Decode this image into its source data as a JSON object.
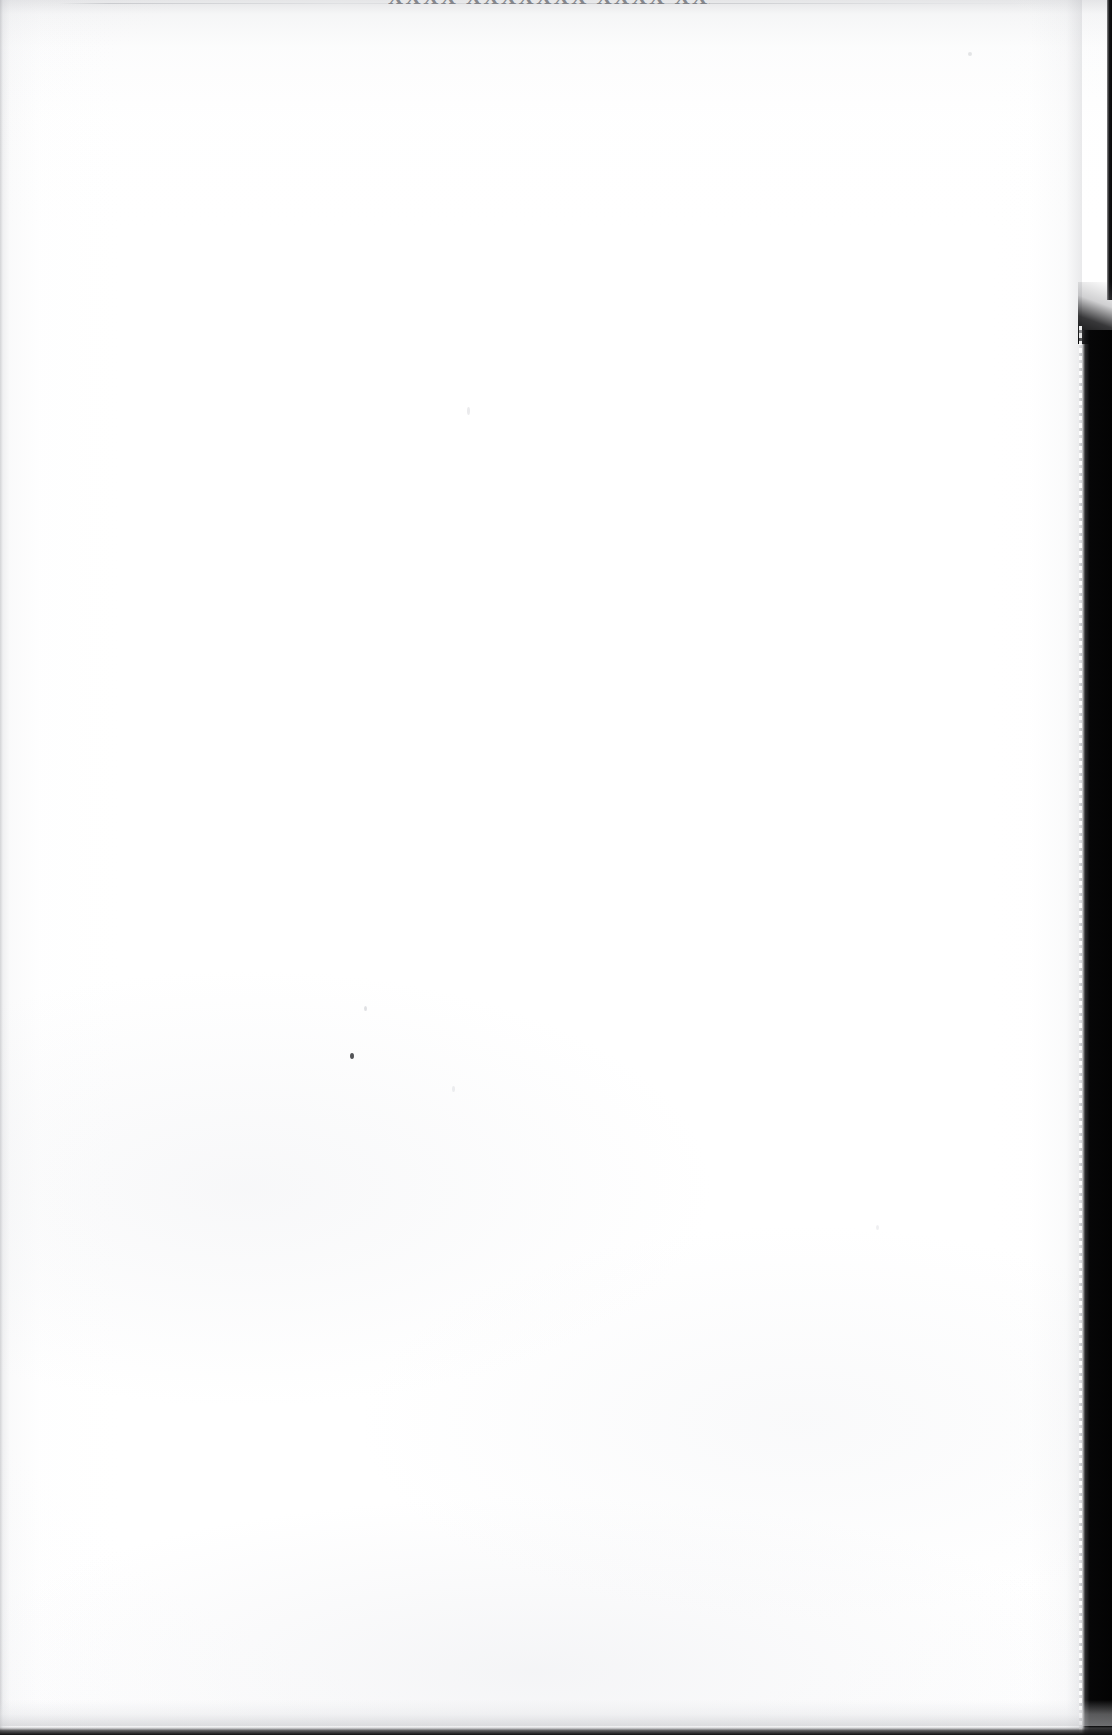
{
  "document": {
    "kind": "scanned-page",
    "page_state": "blank",
    "orientation": "portrait",
    "page_width_px": 1112,
    "page_height_px": 1735,
    "paper_color": "#ffffff",
    "ink_color": "#6e7076",
    "scan_edge_color": "#060607"
  },
  "header": {
    "cropped_running_head": "XXXX XXXXXXX XXXX XXXXX",
    "note": "running head is clipped by the top page boundary; only the bottom pixels of the glyphs are visible"
  },
  "body": {
    "content": "",
    "description": "blank page surface"
  },
  "artifacts": {
    "top_hairline": "top-edge-hairline",
    "left_edge_shading": "left-edge-grey-gradient",
    "top_edge_shading": "top-edge-grey-gradient",
    "right_edge_shading": "right-edge-grey-gradient",
    "right_scan_band": "black-scanner-bed-band",
    "bottom_strip": "bottom-edge-dark-strip",
    "specks": [
      {
        "name": "speck-main",
        "tone": "dark"
      },
      {
        "name": "speck-faint-a",
        "tone": "faint"
      },
      {
        "name": "speck-faint-b",
        "tone": "faint"
      },
      {
        "name": "speck-faint-c",
        "tone": "faint"
      },
      {
        "name": "speck-faint-d",
        "tone": "faint"
      },
      {
        "name": "speck-faint-e",
        "tone": "faint"
      }
    ]
  }
}
